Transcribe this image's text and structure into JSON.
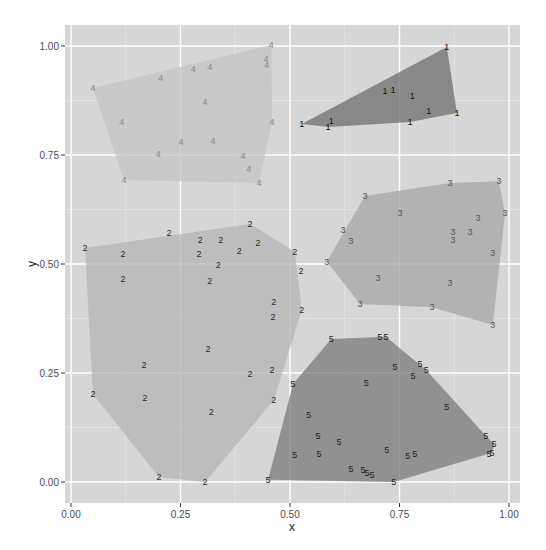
{
  "chart_data": {
    "type": "scatter",
    "title": "",
    "xlabel": "x",
    "ylabel": "y",
    "xlim": [
      -0.015,
      1.025
    ],
    "ylim": [
      -0.048,
      1.05
    ],
    "x_ticks": [
      "0.00",
      "0.25",
      "0.50",
      "0.75",
      "1.00"
    ],
    "y_ticks": [
      "0.00",
      "0.25",
      "0.50",
      "0.75",
      "1.00"
    ],
    "grid": true,
    "legend": "none",
    "annotations": "Points drawn as text labels of their cluster id, with convex hull polygons per cluster",
    "series": [
      {
        "name": "1",
        "fill": "#6e6e6e",
        "text_color": "#111111",
        "points": [
          [
            0.858,
            0.998
          ],
          [
            0.717,
            0.897
          ],
          [
            0.735,
            0.899
          ],
          [
            0.779,
            0.885
          ],
          [
            0.817,
            0.851
          ],
          [
            0.881,
            0.846
          ],
          [
            0.774,
            0.826
          ],
          [
            0.594,
            0.828
          ],
          [
            0.527,
            0.821
          ],
          [
            0.587,
            0.814
          ]
        ],
        "hull": [
          [
            0.858,
            0.998
          ],
          [
            0.881,
            0.846
          ],
          [
            0.774,
            0.826
          ],
          [
            0.587,
            0.814
          ],
          [
            0.527,
            0.821
          ]
        ]
      },
      {
        "name": "2",
        "fill": "#b4b4b4",
        "text_color": "#2a2a2a",
        "points": [
          [
            0.409,
            0.592
          ],
          [
            0.224,
            0.571
          ],
          [
            0.032,
            0.537
          ],
          [
            0.342,
            0.555
          ],
          [
            0.295,
            0.555
          ],
          [
            0.427,
            0.548
          ],
          [
            0.119,
            0.523
          ],
          [
            0.292,
            0.523
          ],
          [
            0.384,
            0.53
          ],
          [
            0.511,
            0.528
          ],
          [
            0.336,
            0.498
          ],
          [
            0.525,
            0.484
          ],
          [
            0.119,
            0.466
          ],
          [
            0.317,
            0.461
          ],
          [
            0.463,
            0.413
          ],
          [
            0.461,
            0.378
          ],
          [
            0.527,
            0.394
          ],
          [
            0.313,
            0.305
          ],
          [
            0.167,
            0.268
          ],
          [
            0.409,
            0.248
          ],
          [
            0.459,
            0.257
          ],
          [
            0.05,
            0.202
          ],
          [
            0.169,
            0.193
          ],
          [
            0.463,
            0.188
          ],
          [
            0.32,
            0.161
          ],
          [
            0.201,
            0.011
          ],
          [
            0.306,
            0.0
          ]
        ],
        "hull": [
          [
            0.032,
            0.537
          ],
          [
            0.409,
            0.592
          ],
          [
            0.511,
            0.528
          ],
          [
            0.527,
            0.394
          ],
          [
            0.463,
            0.188
          ],
          [
            0.306,
            0.0
          ],
          [
            0.201,
            0.011
          ],
          [
            0.05,
            0.202
          ]
        ]
      },
      {
        "name": "3",
        "fill": "#a6a6a6",
        "text_color": "#555555",
        "points": [
          [
            0.865,
            0.686
          ],
          [
            0.977,
            0.69
          ],
          [
            0.671,
            0.656
          ],
          [
            0.751,
            0.617
          ],
          [
            0.991,
            0.617
          ],
          [
            0.929,
            0.606
          ],
          [
            0.621,
            0.578
          ],
          [
            0.872,
            0.573
          ],
          [
            0.911,
            0.573
          ],
          [
            0.872,
            0.555
          ],
          [
            0.639,
            0.553
          ],
          [
            0.584,
            0.505
          ],
          [
            0.963,
            0.525
          ],
          [
            0.701,
            0.468
          ],
          [
            0.865,
            0.456
          ],
          [
            0.66,
            0.408
          ],
          [
            0.824,
            0.401
          ],
          [
            0.963,
            0.36
          ]
        ],
        "hull": [
          [
            0.671,
            0.656
          ],
          [
            0.865,
            0.686
          ],
          [
            0.977,
            0.69
          ],
          [
            0.991,
            0.617
          ],
          [
            0.963,
            0.36
          ],
          [
            0.824,
            0.401
          ],
          [
            0.66,
            0.408
          ],
          [
            0.584,
            0.505
          ]
        ]
      },
      {
        "name": "4",
        "fill": "#c4c4c4",
        "text_color": "#888888",
        "points": [
          [
            0.457,
            1.002
          ],
          [
            0.445,
            0.97
          ],
          [
            0.447,
            0.956
          ],
          [
            0.05,
            0.904
          ],
          [
            0.205,
            0.927
          ],
          [
            0.279,
            0.947
          ],
          [
            0.317,
            0.952
          ],
          [
            0.306,
            0.872
          ],
          [
            0.116,
            0.826
          ],
          [
            0.459,
            0.826
          ],
          [
            0.251,
            0.78
          ],
          [
            0.324,
            0.782
          ],
          [
            0.199,
            0.752
          ],
          [
            0.393,
            0.748
          ],
          [
            0.406,
            0.718
          ],
          [
            0.429,
            0.686
          ],
          [
            0.121,
            0.693
          ]
        ],
        "hull": [
          [
            0.05,
            0.904
          ],
          [
            0.457,
            1.002
          ],
          [
            0.459,
            0.826
          ],
          [
            0.429,
            0.686
          ],
          [
            0.121,
            0.693
          ]
        ]
      },
      {
        "name": "5",
        "fill": "#7a7a7a",
        "text_color": "#1e1e1e",
        "points": [
          [
            0.594,
            0.328
          ],
          [
            0.705,
            0.333
          ],
          [
            0.719,
            0.333
          ],
          [
            0.74,
            0.264
          ],
          [
            0.797,
            0.271
          ],
          [
            0.811,
            0.257
          ],
          [
            0.781,
            0.243
          ],
          [
            0.674,
            0.227
          ],
          [
            0.507,
            0.225
          ],
          [
            0.858,
            0.172
          ],
          [
            0.543,
            0.154
          ],
          [
            0.564,
            0.106
          ],
          [
            0.612,
            0.092
          ],
          [
            0.511,
            0.062
          ],
          [
            0.566,
            0.064
          ],
          [
            0.639,
            0.03
          ],
          [
            0.721,
            0.073
          ],
          [
            0.769,
            0.06
          ],
          [
            0.785,
            0.064
          ],
          [
            0.667,
            0.028
          ],
          [
            0.676,
            0.021
          ],
          [
            0.687,
            0.016
          ],
          [
            0.947,
            0.106
          ],
          [
            0.966,
            0.087
          ],
          [
            0.954,
            0.064
          ],
          [
            0.961,
            0.067
          ],
          [
            0.45,
            0.005
          ],
          [
            0.737,
            0.0
          ]
        ],
        "hull": [
          [
            0.45,
            0.005
          ],
          [
            0.507,
            0.225
          ],
          [
            0.594,
            0.328
          ],
          [
            0.719,
            0.333
          ],
          [
            0.811,
            0.257
          ],
          [
            0.947,
            0.106
          ],
          [
            0.966,
            0.087
          ],
          [
            0.961,
            0.067
          ],
          [
            0.737,
            0.0
          ]
        ]
      }
    ]
  },
  "axes": {
    "x_title": "x",
    "y_title": "y",
    "x_ticks": [
      "0.00",
      "0.25",
      "0.50",
      "0.75",
      "1.00"
    ],
    "y_ticks": [
      "0.00",
      "0.25",
      "0.50",
      "0.75",
      "1.00"
    ]
  },
  "colors": {
    "panel_bg": "#ebebeb",
    "panel_bg_rendered": "#d9d9d9",
    "grid_major": "#ffffff",
    "grid_minor": "#f2f2f2"
  }
}
